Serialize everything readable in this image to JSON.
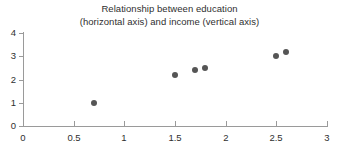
{
  "chart_data": {
    "type": "scatter",
    "title": "Relationship between education (horizontal axis) and income (vertical axis)",
    "title_lines": [
      "Relationship between education",
      "(horizontal axis) and income (vertical axis)"
    ],
    "xlabel": "",
    "ylabel": "",
    "xlim": [
      0,
      3
    ],
    "ylim": [
      0,
      4
    ],
    "xticks": [
      0,
      0.5,
      1,
      1.5,
      2,
      2.5,
      3
    ],
    "xtick_labels": [
      "0",
      "0.5",
      "1",
      "1.5",
      "2",
      "2.5",
      "3"
    ],
    "yticks": [
      0,
      1,
      2,
      3,
      4
    ],
    "ytick_labels": [
      "0",
      "1",
      "2",
      "3",
      "4"
    ],
    "grid": false,
    "legend": false,
    "legend_position": "none",
    "marker": "circle",
    "marker_color": "#555555",
    "axis_color": "#9a9a9a",
    "text_color": "#2f2f2f",
    "background_color": "#ffffff",
    "points": [
      {
        "x": 0.7,
        "y": 1.0
      },
      {
        "x": 1.5,
        "y": 2.2
      },
      {
        "x": 1.7,
        "y": 2.4
      },
      {
        "x": 1.8,
        "y": 2.5
      },
      {
        "x": 2.5,
        "y": 3.0
      },
      {
        "x": 2.6,
        "y": 3.2
      }
    ],
    "x": [
      0.7,
      1.5,
      1.7,
      1.8,
      2.5,
      2.6
    ],
    "values": [
      1.0,
      2.2,
      2.4,
      2.5,
      3.0,
      3.2
    ]
  }
}
